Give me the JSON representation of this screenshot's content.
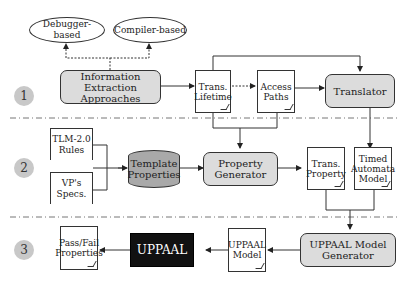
{
  "stages": [
    {
      "id": 1,
      "label": "1"
    },
    {
      "id": 2,
      "label": "2"
    },
    {
      "id": 3,
      "label": "3"
    }
  ],
  "nodes": {
    "debugger": "Debugger-based",
    "compiler": "Compiler-based",
    "info_extraction": "Information Extraction Approaches",
    "trans_lifetime": "Trans. Lifetime",
    "access_paths": "Access Paths",
    "translator": "Translator",
    "tlm_rules": "TLM-2.0 Rules",
    "vp_specs": "VP's Specs.",
    "template_props": "Template Properties",
    "property_gen": "Property Generator",
    "trans_property": "Trans. Property",
    "timed_automata": "Timed Automata Model",
    "pass_fail": "Pass/Fail Properties",
    "uppaal": "UPPAAL",
    "uppaal_model": "UPPAAL Model",
    "uppaal_model_gen": "UPPAAL Model Generator"
  },
  "colors": {
    "process_fill": "#dcdcdc",
    "badge_fill": "#c8c8c8",
    "database_fill": "#a9a9a9",
    "tool_fill": "#111111"
  }
}
